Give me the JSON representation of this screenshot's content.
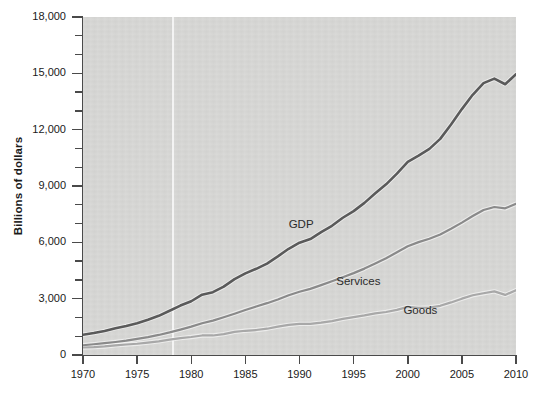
{
  "chart_data": {
    "type": "line",
    "title": "",
    "xlabel": "",
    "ylabel": "Billions of dollars",
    "xlim": [
      1970,
      2010
    ],
    "ylim": [
      0,
      18000
    ],
    "grid": false,
    "legend_position": "inline-annotations",
    "x_ticks": [
      "1970",
      "1975",
      "1980",
      "1985",
      "1990",
      "1995",
      "2000",
      "2005",
      "2010"
    ],
    "x_tick_values": [
      1970,
      1975,
      1980,
      1985,
      1990,
      1995,
      2000,
      2005,
      2010
    ],
    "y_ticks": [
      "0",
      "3,000",
      "6,000",
      "9,000",
      "12,000",
      "15,000",
      "18,000"
    ],
    "y_tick_values": [
      0,
      3000,
      6000,
      9000,
      12000,
      15000,
      18000
    ],
    "y_minor_step": 1000,
    "x": [
      1970,
      1971,
      1972,
      1973,
      1974,
      1975,
      1976,
      1977,
      1978,
      1979,
      1980,
      1981,
      1982,
      1983,
      1984,
      1985,
      1986,
      1987,
      1988,
      1989,
      1990,
      1991,
      1992,
      1993,
      1994,
      1995,
      1996,
      1997,
      1998,
      1999,
      2000,
      2001,
      2002,
      2003,
      2004,
      2005,
      2006,
      2007,
      2008,
      2009,
      2010
    ],
    "series": [
      {
        "name": "GDP",
        "color": "#5a5a5a",
        "label_x": 1989.0,
        "label_y": 6850,
        "values": [
          1076,
          1168,
          1282,
          1429,
          1549,
          1689,
          1878,
          2086,
          2357,
          2632,
          2863,
          3211,
          3345,
          3638,
          4041,
          4347,
          4590,
          4870,
          5253,
          5658,
          5980,
          6174,
          6539,
          6879,
          7309,
          7664,
          8100,
          8609,
          9089,
          9661,
          10285,
          10622,
          10978,
          11511,
          12275,
          13094,
          13856,
          14478,
          14719,
          14419,
          14959
        ]
      },
      {
        "name": "Services",
        "color": "#8a8a8a",
        "label_x": 1993.4,
        "label_y": 3820,
        "values": [
          520,
          572,
          628,
          692,
          766,
          858,
          952,
          1068,
          1202,
          1350,
          1510,
          1690,
          1830,
          2010,
          2200,
          2400,
          2580,
          2760,
          2960,
          3180,
          3370,
          3520,
          3720,
          3930,
          4140,
          4360,
          4600,
          4870,
          5150,
          5470,
          5790,
          6010,
          6190,
          6420,
          6720,
          7050,
          7400,
          7720,
          7880,
          7810,
          8050
        ]
      },
      {
        "name": "Goods",
        "color": "#a8a8a8",
        "label_x": 1999.6,
        "label_y": 2280,
        "values": [
          400,
          420,
          455,
          510,
          560,
          600,
          660,
          730,
          820,
          900,
          960,
          1040,
          1040,
          1110,
          1230,
          1290,
          1330,
          1400,
          1510,
          1600,
          1660,
          1660,
          1720,
          1800,
          1920,
          2020,
          2110,
          2220,
          2290,
          2400,
          2560,
          2510,
          2530,
          2620,
          2800,
          3000,
          3180,
          3290,
          3390,
          3200,
          3450
        ]
      }
    ]
  },
  "axes": {
    "ylabel_text": "Billions of dollars"
  }
}
